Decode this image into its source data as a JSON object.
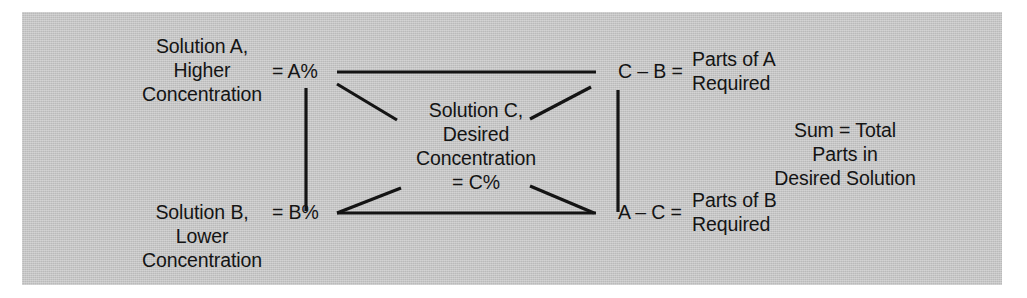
{
  "figure": {
    "kind": "alligation-method-diagram",
    "background_color": "#ffffff",
    "panel_color": "#c6c6c6",
    "line_color": "#141414"
  },
  "nodes": {
    "solution_a_label": "Solution A,\nHigher\nConcentration",
    "solution_a_value": "= A%",
    "solution_b_label": "Solution B,\nLower\nConcentration",
    "solution_b_value": "= B%",
    "solution_c_label": "Solution C,\nDesired\nConcentration\n= C%",
    "parts_a_value": "C – B =",
    "parts_a_label": "Parts of A\nRequired",
    "parts_b_value": "A – C =",
    "parts_b_label": "Parts of B\nRequired",
    "sum_total_label": "Sum = Total\nParts in\nDesired Solution"
  },
  "connectors": [
    {
      "name": "top-horizontal-a-to-cb",
      "x1": 337,
      "y1": 72,
      "x2": 596,
      "y2": 72
    },
    {
      "name": "bottom-horizontal-b-to-ac",
      "x1": 337,
      "y1": 213,
      "x2": 596,
      "y2": 213
    },
    {
      "name": "left-vertical-a-to-b",
      "x1": 306,
      "y1": 88,
      "x2": 306,
      "y2": 211
    },
    {
      "name": "right-vertical-cb-to-ac",
      "x1": 618,
      "y1": 90,
      "x2": 618,
      "y2": 212
    },
    {
      "name": "diagonal-a-to-c",
      "x1": 337,
      "y1": 84,
      "x2": 397,
      "y2": 120
    },
    {
      "name": "diagonal-b-to-c",
      "x1": 337,
      "y1": 213,
      "x2": 401,
      "y2": 188
    },
    {
      "name": "diagonal-c-to-cb",
      "x1": 530,
      "y1": 119,
      "x2": 591,
      "y2": 87
    },
    {
      "name": "diagonal-c-to-ac",
      "x1": 530,
      "y1": 186,
      "x2": 594,
      "y2": 213
    }
  ]
}
